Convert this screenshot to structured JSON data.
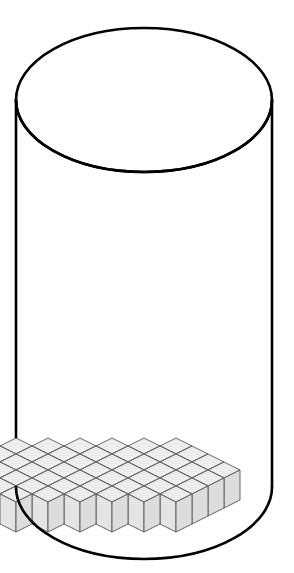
{
  "figure": {
    "type": "isometric-3d-illustration",
    "background_color": "#ffffff",
    "caption": ""
  },
  "cylinder": {
    "name": "transparent-cylinder",
    "outline_color": "#000000",
    "outline_width": 2.6,
    "fill": "none",
    "center_x": 144,
    "top_ellipse_center_y": 100,
    "bottom_ellipse_center_y": 487,
    "radius_x": 128,
    "radius_y": 72,
    "wall_left_x": 16,
    "wall_right_x": 272,
    "top_y": 28,
    "bottom_y": 559
  },
  "cube_geometry": {
    "half_width": 16,
    "half_depth": 8,
    "height": 30,
    "top_face_color": "#ededed",
    "left_face_color": "#e4e4e4",
    "right_face_color": "#dcdcdc",
    "edge_color": "#555555",
    "edge_width": 0.9
  },
  "base_layer": {
    "name": "base-cube-layer",
    "description": "single layer of unit cubes covering the circular floor",
    "origin_x": 144,
    "origin_y": 430,
    "rows": [
      {
        "row": 0,
        "cols": [
          2,
          3,
          4,
          5
        ]
      },
      {
        "row": 1,
        "cols": [
          1,
          2,
          3,
          4,
          5
        ]
      },
      {
        "row": 2,
        "cols": [
          0,
          1,
          2,
          3,
          4,
          5
        ]
      },
      {
        "row": 3,
        "cols": [
          -1,
          0,
          1,
          2,
          3,
          4,
          5
        ]
      },
      {
        "row": 4,
        "cols": [
          -2,
          -1,
          0,
          1,
          2,
          3,
          4
        ]
      },
      {
        "row": 5,
        "cols": [
          -3,
          -2,
          -1,
          0,
          1,
          2,
          3
        ]
      },
      {
        "row": 6,
        "cols": [
          -4,
          -3,
          -2,
          -1,
          0,
          1,
          2
        ]
      },
      {
        "row": 7,
        "cols": [
          -4,
          -3,
          -2,
          -1,
          0,
          1
        ]
      },
      {
        "row": 8,
        "cols": [
          -4,
          -3,
          -2,
          -1,
          0
        ]
      }
    ],
    "cube_count": 49
  },
  "column": {
    "name": "cube-column",
    "description": "vertical stack of unit cubes rising from the base layer",
    "grid_row": 2,
    "grid_col": -4,
    "stack_height": 12,
    "base_x": 60,
    "base_y": 410,
    "top_y": 50
  },
  "counts": {
    "base_layer_cubes": 49,
    "column_cubes": 12,
    "total_cubes": 61
  },
  "palette": {
    "paper": "#ffffff",
    "ink": "#000000",
    "cube_light": "#ededed",
    "cube_mid": "#e4e4e4",
    "cube_dark": "#dcdcdc",
    "cube_edge": "#555555"
  }
}
